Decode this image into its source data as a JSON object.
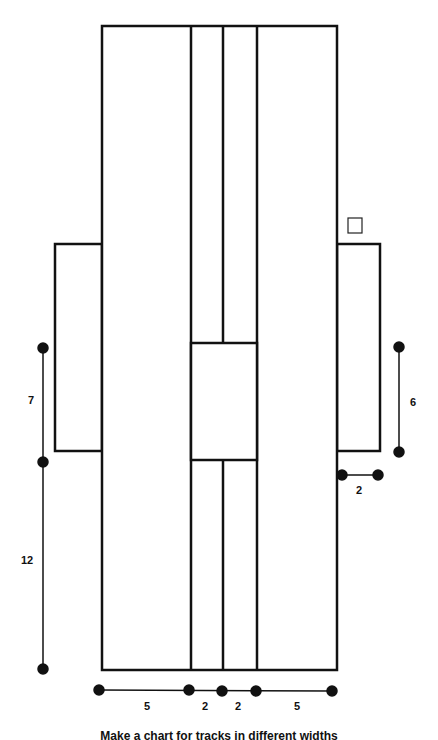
{
  "diagram": {
    "type": "floor-plan-schematic",
    "stroke_color": "#111111",
    "background": "#ffffff",
    "main_rect": {
      "x": 102,
      "y": 26,
      "w": 235,
      "h": 644
    },
    "dividers_x": [
      191,
      223,
      257
    ],
    "center_box": {
      "x": 191,
      "y": 343,
      "w": 66,
      "h": 117
    },
    "left_wing": {
      "x": 55,
      "y": 244,
      "w": 47,
      "h": 207
    },
    "right_wing": {
      "x": 337,
      "y": 244,
      "w": 43,
      "h": 207
    },
    "small_square": {
      "x": 348,
      "y": 218,
      "w": 14,
      "h": 15
    }
  },
  "dimensions": {
    "left_upper": {
      "label": "7",
      "x": 43,
      "y1": 348,
      "y2": 462
    },
    "left_lower": {
      "label": "12",
      "x": 43,
      "y1": 462,
      "y2": 669
    },
    "right_vertical": {
      "label": "6",
      "x": 399,
      "y1": 347,
      "y2": 452
    },
    "right_horizontal": {
      "label": "2",
      "y": 475,
      "x1": 342,
      "x2": 378
    },
    "bottom": {
      "y": 690,
      "points_x": [
        99,
        189,
        222,
        256,
        332
      ],
      "labels": [
        "5",
        "2",
        "2",
        "5"
      ]
    }
  },
  "caption": "Make a chart for tracks in different widths"
}
